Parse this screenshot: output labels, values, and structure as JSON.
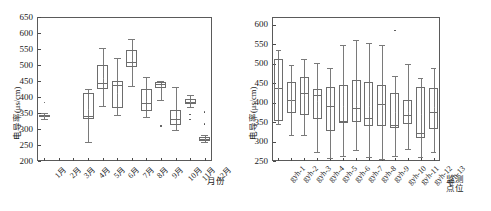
{
  "figure": {
    "background": "#ffffff",
    "line_color": "#6d6d6d",
    "axis_color": "#5a5a5a"
  },
  "chart_data": [
    {
      "id": "left",
      "type": "box",
      "title": "",
      "xlabel": "月份",
      "ylabel": "电导率(μs/cm)",
      "ylim": [
        200,
        650
      ],
      "yticks": [
        200,
        250,
        300,
        350,
        400,
        450,
        500,
        550,
        600,
        650
      ],
      "grid": false,
      "legend": "none",
      "categories": [
        "1月",
        "2月",
        "3月",
        "4月",
        "5月",
        "6月",
        "7月",
        "8月",
        "9月",
        "10月",
        "11月",
        "12月"
      ],
      "boxes": [
        {
          "cat": "1月",
          "min": 331,
          "q1": 336,
          "median": 340,
          "q3": 345,
          "max": 349,
          "mean": 340,
          "outliers": [
            383
          ]
        },
        {
          "cat": "2月",
          "min": null,
          "q1": null,
          "median": null,
          "q3": null,
          "max": null,
          "mean": null,
          "outliers": []
        },
        {
          "cat": "3月",
          "min": null,
          "q1": null,
          "median": null,
          "q3": null,
          "max": null,
          "mean": null,
          "outliers": []
        },
        {
          "cat": "4月",
          "min": 260,
          "q1": 331,
          "median": 340,
          "q3": 414,
          "max": 424,
          "mean": 361,
          "outliers": []
        },
        {
          "cat": "5月",
          "min": 371,
          "q1": 424,
          "median": 443,
          "q3": 500,
          "max": 552,
          "mean": 458,
          "outliers": []
        },
        {
          "cat": "6月",
          "min": 345,
          "q1": 367,
          "median": 438,
          "q3": 451,
          "max": 523,
          "mean": 414,
          "outliers": []
        },
        {
          "cat": "7月",
          "min": 433,
          "q1": 495,
          "median": 510,
          "q3": 548,
          "max": 581,
          "mean": 516,
          "outliers": []
        },
        {
          "cat": "8月",
          "min": 338,
          "q1": 357,
          "median": 382,
          "q3": 425,
          "max": 464,
          "mean": 389,
          "outliers": []
        },
        {
          "cat": "9月",
          "min": 391,
          "q1": 428,
          "median": 440,
          "q3": 446,
          "max": 450,
          "mean": 433,
          "outliers": [
            309
          ]
        },
        {
          "cat": "10月",
          "min": 298,
          "q1": 313,
          "median": 332,
          "q3": 359,
          "max": 430,
          "mean": 339,
          "outliers": []
        },
        {
          "cat": "11月",
          "min": 370,
          "q1": 378,
          "median": 385,
          "q3": 393,
          "max": 405,
          "mean": 385,
          "outliers": [
            345,
            330
          ]
        },
        {
          "cat": "12月",
          "min": 258,
          "q1": 263,
          "median": 269,
          "q3": 276,
          "max": 281,
          "mean": 270,
          "outliers": [
            353,
            315
          ]
        }
      ]
    },
    {
      "id": "right",
      "type": "box",
      "title": "",
      "xlabel": "监测点位",
      "xlabel_line1": "监测",
      "xlabel_line2": "点位",
      "ylabel": "电导率(μs/cm)",
      "ylim": [
        250,
        620
      ],
      "yticks": [
        250,
        300,
        350,
        400,
        450,
        500,
        550,
        600
      ],
      "grid": false,
      "legend": "none",
      "categories": [
        "gyh-1",
        "gyh-2",
        "gyh-3",
        "gyh-4",
        "gyh-5",
        "gyh-6",
        "gyh-7",
        "gyh-8",
        "gyh-9",
        "gyh-10",
        "gyh-11",
        "gyh-12",
        "gyh-13"
      ],
      "boxes": [
        {
          "cat": "gyh-1",
          "min": 345,
          "q1": 352,
          "median": 437,
          "q3": 512,
          "max": 535,
          "mean": 437,
          "outliers": []
        },
        {
          "cat": "gyh-2",
          "min": 317,
          "q1": 374,
          "median": 407,
          "q3": 452,
          "max": 497,
          "mean": 408,
          "outliers": []
        },
        {
          "cat": "gyh-3",
          "min": 317,
          "q1": 367,
          "median": 425,
          "q3": 465,
          "max": 512,
          "mean": 419,
          "outliers": []
        },
        {
          "cat": "gyh-4",
          "min": 274,
          "q1": 357,
          "median": 420,
          "q3": 436,
          "max": 501,
          "mean": 405,
          "outliers": []
        },
        {
          "cat": "gyh-5",
          "min": 258,
          "q1": 327,
          "median": 391,
          "q3": 440,
          "max": 489,
          "mean": 386,
          "outliers": []
        },
        {
          "cat": "gyh-6",
          "min": 263,
          "q1": 348,
          "median": 353,
          "q3": 446,
          "max": 548,
          "mean": 392,
          "outliers": []
        },
        {
          "cat": "gyh-7",
          "min": 279,
          "q1": 350,
          "median": 385,
          "q3": 458,
          "max": 562,
          "mean": 394,
          "outliers": []
        },
        {
          "cat": "gyh-8",
          "min": 260,
          "q1": 340,
          "median": 361,
          "q3": 453,
          "max": 552,
          "mean": 392,
          "outliers": []
        },
        {
          "cat": "gyh-9",
          "min": 254,
          "q1": 341,
          "median": 396,
          "q3": 445,
          "max": 549,
          "mean": 394,
          "outliers": []
        },
        {
          "cat": "gyh-10",
          "min": 263,
          "q1": 335,
          "median": 342,
          "q3": 424,
          "max": 468,
          "mean": 375,
          "outliers": [
            585
          ]
        },
        {
          "cat": "gyh-11",
          "min": 281,
          "q1": 345,
          "median": 368,
          "q3": 408,
          "max": 500,
          "mean": 376,
          "outliers": []
        },
        {
          "cat": "gyh-12",
          "min": 259,
          "q1": 310,
          "median": 322,
          "q3": 440,
          "max": 464,
          "mean": 372,
          "outliers": []
        },
        {
          "cat": "gyh-13",
          "min": 274,
          "q1": 331,
          "median": 376,
          "q3": 437,
          "max": 489,
          "mean": 388,
          "outliers": []
        }
      ]
    }
  ]
}
